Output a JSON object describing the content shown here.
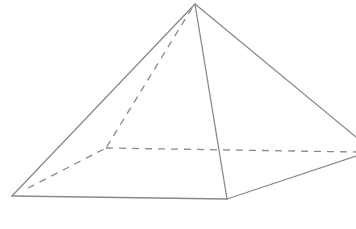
{
  "diagram": {
    "type": "square-pyramid",
    "stroke_color": "#8a8a8a",
    "background": "#ffffff",
    "vertices": {
      "apex": [
        195,
        4
      ],
      "front_left": [
        12,
        196
      ],
      "front_right": [
        227,
        199
      ],
      "right": [
        356,
        140
      ],
      "back_left": [
        106,
        148
      ]
    },
    "edges": {
      "visible": [
        [
          "apex",
          "front_left"
        ],
        [
          "apex",
          "front_right"
        ],
        [
          "apex",
          "right"
        ],
        [
          "front_left",
          "front_right"
        ],
        [
          "front_right",
          "right"
        ]
      ],
      "hidden": [
        [
          "apex",
          "back_left"
        ],
        [
          "front_left",
          "back_left"
        ],
        [
          "back_left",
          "right"
        ]
      ]
    }
  }
}
